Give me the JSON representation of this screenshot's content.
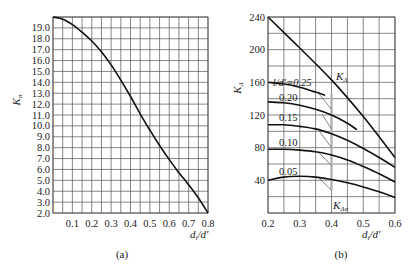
{
  "chart_data": [
    {
      "id": "a",
      "type": "line",
      "caption": "(a)",
      "xlabel": "d_i/d'",
      "ylabel": "K_σ",
      "xlim": [
        0,
        0.8
      ],
      "ylim": [
        2.0,
        20.0
      ],
      "xticks": [
        "0.1",
        "0.2",
        "0.3",
        "0.4",
        "0.5",
        "0.6",
        "0.7",
        "0.8"
      ],
      "yticks": [
        "2.0",
        "3.0",
        "4.0",
        "5.0",
        "6.0",
        "7.0",
        "8.0",
        "9.0",
        "10.0",
        "11.0",
        "12.0",
        "13.0",
        "14.0",
        "15.0",
        "16.0",
        "17.0",
        "18.0",
        "19.0"
      ],
      "grid": true,
      "series": [
        {
          "name": "K_σ",
          "x": [
            0.0,
            0.05,
            0.1,
            0.15,
            0.2,
            0.25,
            0.3,
            0.35,
            0.4,
            0.45,
            0.5,
            0.55,
            0.6,
            0.65,
            0.7,
            0.75,
            0.8
          ],
          "y": [
            20.0,
            19.8,
            19.3,
            18.6,
            17.8,
            16.8,
            15.6,
            14.2,
            12.7,
            11.1,
            9.6,
            8.2,
            6.9,
            5.7,
            4.6,
            3.4,
            2.0
          ]
        }
      ]
    },
    {
      "id": "b",
      "type": "line",
      "caption": "(b)",
      "xlabel": "d_i/d'",
      "ylabel": "K_Δ",
      "xlim": [
        0.2,
        0.6
      ],
      "ylim": [
        0,
        240
      ],
      "xticks": [
        "0.2",
        "0.3",
        "0.4",
        "0.5",
        "0.6"
      ],
      "yticks": [
        "40",
        "80",
        "120",
        "160",
        "200",
        "240"
      ],
      "grid": true,
      "annotations": [
        "l/d'=0.25",
        "K_Δ",
        "K_Δσ"
      ],
      "series": [
        {
          "name": "K_Δ",
          "label": "K_Δ",
          "x": [
            0.2,
            0.3,
            0.4,
            0.5,
            0.6
          ],
          "y": [
            240,
            202,
            163,
            118,
            68
          ]
        },
        {
          "name": "l/d'=0.25",
          "label": "l/d'=0.25",
          "x": [
            0.2,
            0.25,
            0.3,
            0.35,
            0.38
          ],
          "y": [
            160,
            158,
            154,
            148,
            144
          ]
        },
        {
          "name": "l/d'=0.20",
          "label": "0.20",
          "x": [
            0.2,
            0.25,
            0.3,
            0.35,
            0.4,
            0.45,
            0.48
          ],
          "y": [
            136,
            135,
            132,
            127,
            120,
            110,
            102
          ]
        },
        {
          "name": "l/d'=0.15",
          "label": "0.15",
          "x": [
            0.2,
            0.25,
            0.3,
            0.35,
            0.4,
            0.45,
            0.5,
            0.55,
            0.6
          ],
          "y": [
            108,
            108,
            106,
            103,
            97,
            89,
            79,
            68,
            56
          ]
        },
        {
          "name": "l/d'=0.10",
          "label": "0.10",
          "x": [
            0.2,
            0.25,
            0.3,
            0.35,
            0.4,
            0.45,
            0.5,
            0.55,
            0.6
          ],
          "y": [
            78,
            78,
            77,
            75,
            71,
            65,
            57,
            48,
            38
          ]
        },
        {
          "name": "l/d'=0.05",
          "label": "0.05",
          "x": [
            0.2,
            0.25,
            0.3,
            0.35,
            0.4,
            0.45,
            0.5,
            0.55,
            0.6
          ],
          "y": [
            40,
            44,
            45,
            44,
            41,
            37,
            32,
            26,
            19
          ]
        }
      ],
      "K_Δσ_leaders": {
        "x_band": 0.4,
        "segments": [
          {
            "from": [
              0.36,
              146
            ],
            "to": [
              0.4,
              127
            ]
          },
          {
            "from": [
              0.37,
              121
            ],
            "to": [
              0.4,
              103
            ]
          },
          {
            "from": [
              0.36,
              101
            ],
            "to": [
              0.4,
              80
            ]
          },
          {
            "from": [
              0.36,
              74
            ],
            "to": [
              0.4,
              58
            ]
          },
          {
            "from": [
              0.36,
              43
            ],
            "to": [
              0.4,
              28
            ]
          }
        ]
      }
    }
  ]
}
